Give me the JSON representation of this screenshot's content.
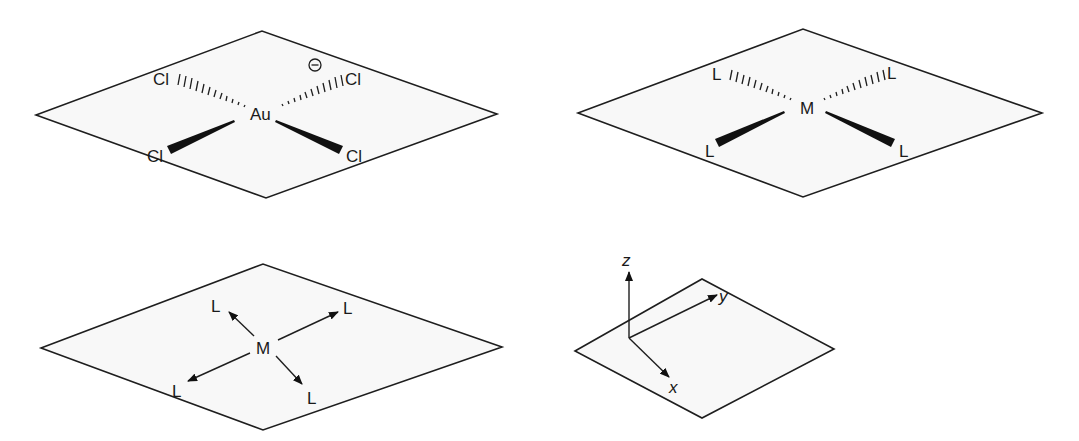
{
  "figures": {
    "aucl4": {
      "center_atom": "Au",
      "ligands": [
        "Cl",
        "Cl",
        "Cl",
        "Cl"
      ],
      "charge_symbol": "−",
      "bond_types": [
        "hashed",
        "hashed",
        "wedge",
        "wedge"
      ]
    },
    "ml4_stereo": {
      "center_atom": "M",
      "ligands": [
        "L",
        "L",
        "L",
        "L"
      ],
      "bond_types": [
        "hashed",
        "hashed",
        "wedge",
        "wedge"
      ]
    },
    "ml4_arrows": {
      "center_atom": "M",
      "ligands": [
        "L",
        "L",
        "L",
        "L"
      ],
      "bond_types": [
        "arrow",
        "arrow",
        "arrow",
        "arrow"
      ]
    },
    "axes": {
      "labels": {
        "z": "z",
        "y": "y",
        "x": "x"
      }
    }
  },
  "colors": {
    "stroke": "#1e1e1e",
    "plane_fill": "#f8f8f8",
    "background": "#ffffff"
  }
}
